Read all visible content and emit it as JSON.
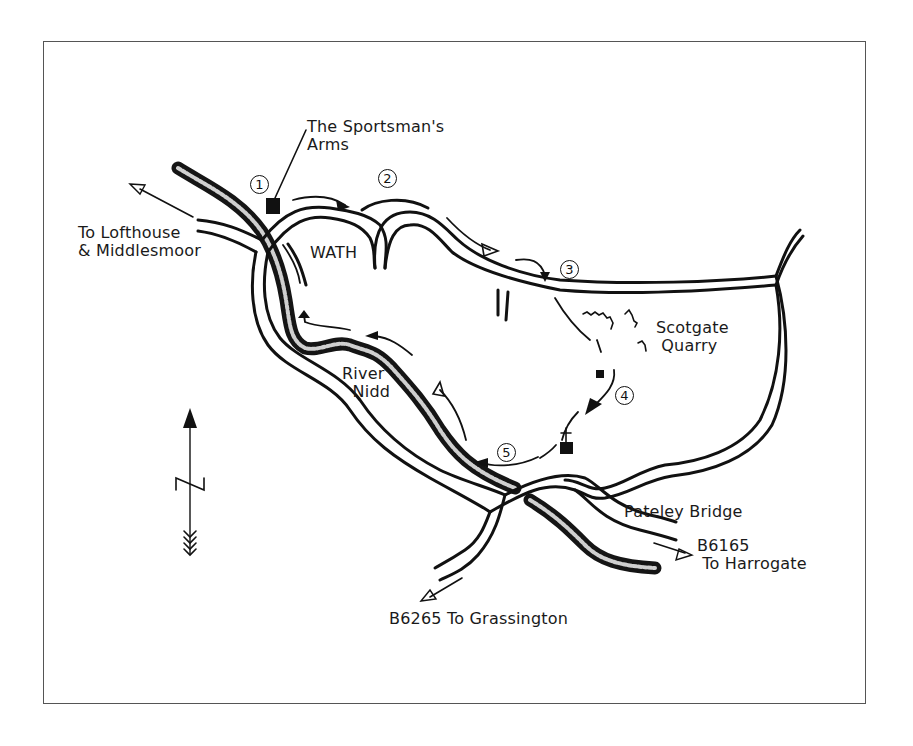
{
  "map": {
    "title": "Walk route map: Wath to Pateley Bridge",
    "colors": {
      "ink": "#111111",
      "frame": "#555555",
      "background": "#ffffff"
    },
    "labels": {
      "pub": "The Sportsman's\nArms",
      "lofthouse": "To Lofthouse\n& Middlesmoor",
      "wath": "WATH",
      "quarry": "Scotgate\n Quarry",
      "river": "River\n  Nidd",
      "pateley": "Pateley Bridge",
      "harrogate": "B6165\n To Harrogate",
      "grassington": "B6265 To Grassington"
    },
    "waypoints": [
      {
        "number": "1"
      },
      {
        "number": "2"
      },
      {
        "number": "3"
      },
      {
        "number": "4"
      },
      {
        "number": "5"
      }
    ],
    "symbols": {
      "north_arrow": "north-arrow-icon",
      "pub": "building-icon",
      "church": "church-icon",
      "quarry": "quarry-hatching-icon"
    }
  }
}
